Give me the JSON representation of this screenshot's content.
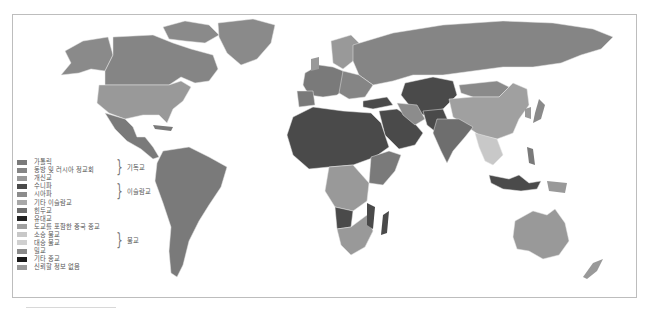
{
  "map": {
    "title": "세계 종교 분포",
    "colors": {
      "catholic": "#7a7a7a",
      "orthodox": "#858585",
      "protestant": "#999999",
      "sunni": "#4a4a4a",
      "shia": "#8c8c8c",
      "other_islam": "#a8a8a8",
      "hindu": "#6e6e6e",
      "jewish": "#222222",
      "chinese": "#a0a0a0",
      "theravada": "#c8c8c8",
      "mahayana": "#d0d0d0",
      "vajrayana": "#8a8a8a",
      "other": "#1a1a1a",
      "no_data": "#9a9a9a",
      "border": "#e6e6e6"
    }
  },
  "legend": {
    "items": [
      {
        "label": "가톨릭",
        "color": "#7a7a7a"
      },
      {
        "label": "동방 및 러시아 정교회",
        "color": "#858585"
      },
      {
        "label": "개신교",
        "color": "#999999"
      },
      {
        "label": "수니파",
        "color": "#4a4a4a"
      },
      {
        "label": "시아파",
        "color": "#8c8c8c"
      },
      {
        "label": "기타 이슬람교",
        "color": "#a8a8a8"
      },
      {
        "label": "힌두교",
        "color": "#6e6e6e"
      },
      {
        "label": "유대교",
        "color": "#222222"
      },
      {
        "label": "도교를 포함한 중국 종교",
        "color": "#a0a0a0"
      },
      {
        "label": "소승 불교",
        "color": "#c8c8c8"
      },
      {
        "label": "대승 불교",
        "color": "#d0d0d0"
      },
      {
        "label": "밀교",
        "color": "#8a8a8a"
      },
      {
        "label": "기타 종교",
        "color": "#1a1a1a"
      },
      {
        "label": "신뢰할 정보 없음",
        "color": "#9a9a9a"
      }
    ],
    "groups": [
      {
        "label": "기독교"
      },
      {
        "label": "이슬람교"
      },
      {
        "label": "불교"
      }
    ]
  }
}
